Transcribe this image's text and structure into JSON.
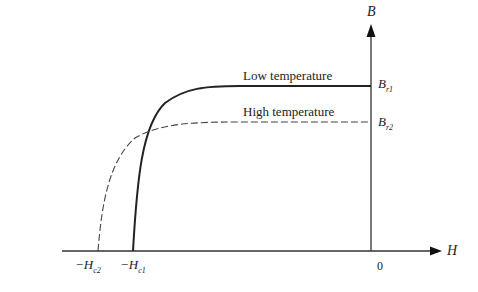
{
  "diagram": {
    "type": "demagnetization-curves",
    "axes": {
      "y_label": "B",
      "x_label": "H",
      "origin_label": "0"
    },
    "curves": [
      {
        "name": "Low temperature",
        "style": "solid",
        "remanence_label": "B",
        "remanence_sub": "r1",
        "coercivity_label": "−H",
        "coercivity_sub": "c1"
      },
      {
        "name": "High temperature",
        "style": "dashed",
        "remanence_label": "B",
        "remanence_sub": "r2",
        "coercivity_label": "−H",
        "coercivity_sub": "c2"
      }
    ]
  }
}
